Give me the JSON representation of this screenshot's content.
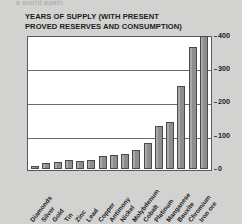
{
  "top_clip_text": "a world again",
  "title": {
    "line1": "YEARS OF SUPPLY (WITH PRESENT",
    "line2": "PROVED RESERVES AND CONSUMPTION)"
  },
  "colors": {
    "page_background": "#d2d2d0",
    "plot_background": "#ffffff",
    "bar_fill": "#8e8e8c",
    "bar_outline": "#4a4a4c",
    "gridline": "#6a6a6c",
    "text": "#1c1c1c"
  },
  "chart_data": {
    "type": "bar",
    "title": "YEARS OF SUPPLY (WITH PRESENT PROVED RESERVES AND CONSUMPTION)",
    "xlabel": "",
    "ylabel": "",
    "ylim": [
      0,
      400
    ],
    "yticks": [
      0,
      100,
      200,
      300,
      400
    ],
    "ytick_labels": [
      "0",
      "100",
      "200",
      "300",
      "400"
    ],
    "grid": true,
    "legend": "none",
    "categories": [
      "Diamonds",
      "Silver",
      "Gold",
      "Tin",
      "Zinc",
      "Lead",
      "Copper",
      "Antimony",
      "Nickel",
      "Molybdenum",
      "Cobalt",
      "Platinum",
      "Manganese",
      "Bauxite",
      "Chromium",
      "Iron ore"
    ],
    "values": [
      8,
      18,
      22,
      28,
      25,
      28,
      38,
      42,
      45,
      58,
      78,
      130,
      140,
      250,
      365,
      400
    ]
  }
}
